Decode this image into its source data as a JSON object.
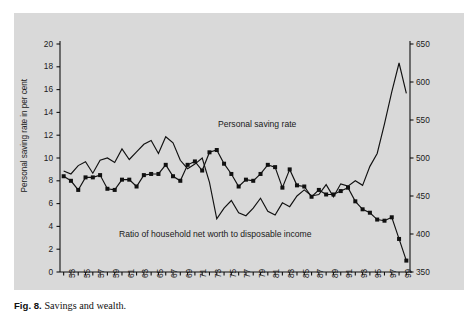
{
  "figure": {
    "caption_label": "Fig. 8.",
    "caption_text": "Savings and wealth."
  },
  "chart_data": {
    "type": "line",
    "title": "",
    "subtitle": "",
    "xlabel": "",
    "grid": false,
    "legend_position": "inline-annotation",
    "x": [
      1953,
      1954,
      1955,
      1956,
      1957,
      1958,
      1959,
      1960,
      1961,
      1962,
      1963,
      1964,
      1965,
      1966,
      1967,
      1968,
      1969,
      1970,
      1971,
      1972,
      1973,
      1974,
      1975,
      1976,
      1977,
      1978,
      1979,
      1980,
      1981,
      1982,
      1983,
      1984,
      1985,
      1986,
      1987,
      1988,
      1989,
      1990,
      1991,
      1992,
      1993,
      1994,
      1995,
      1996,
      1997,
      1998,
      1999,
      2000
    ],
    "xtick_labels": [
      "53",
      "55",
      "57",
      "59",
      "61",
      "63",
      "65",
      "67",
      "69",
      "71",
      "73",
      "75",
      "77",
      "79",
      "81",
      "83",
      "85",
      "87",
      "89",
      "91",
      "93",
      "95",
      "97",
      "99"
    ],
    "xtick_every_years": 2,
    "xlim": [
      1952.5,
      2000.5
    ],
    "axes": [
      {
        "id": "left",
        "label": "Personal saving rate in per cent",
        "ylim": [
          0,
          20
        ],
        "ytick_step": 2,
        "ytick_labels": [
          "0",
          "2",
          "4",
          "6",
          "8",
          "10",
          "12",
          "14",
          "16",
          "18",
          "20"
        ]
      },
      {
        "id": "right",
        "label": "Household net worth as ratio to disposable income, in per cent",
        "ylim": [
          350,
          650
        ],
        "ytick_step": 50,
        "ytick_labels": [
          "350",
          "400",
          "450",
          "500",
          "550",
          "600",
          "650"
        ]
      }
    ],
    "series": [
      {
        "name": "Personal saving rate",
        "axis": "left",
        "marker": "square",
        "color": "#111111",
        "annotation": "Personal saving rate",
        "values": [
          8.4,
          8.0,
          7.2,
          8.3,
          8.3,
          8.5,
          7.3,
          7.2,
          8.1,
          8.1,
          7.5,
          8.5,
          8.6,
          8.6,
          9.4,
          8.4,
          8.0,
          9.4,
          9.7,
          8.9,
          10.5,
          10.7,
          9.5,
          8.6,
          7.5,
          8.1,
          8.0,
          8.6,
          9.4,
          9.2,
          7.4,
          9.0,
          7.6,
          7.5,
          6.6,
          7.2,
          6.8,
          6.8,
          7.1,
          7.4,
          6.2,
          5.5,
          5.2,
          4.6,
          4.5,
          4.8,
          2.9,
          1.0
        ]
      },
      {
        "name": "Ratio of household net worth to disposable income",
        "axis": "right",
        "marker": "none",
        "color": "#111111",
        "annotation": "Ratio of household net worth to disposable income",
        "values": [
          483,
          479,
          490,
          495,
          480,
          497,
          500,
          494,
          512,
          498,
          508,
          518,
          523,
          506,
          528,
          520,
          497,
          486,
          492,
          500,
          468,
          420,
          434,
          444,
          428,
          424,
          434,
          447,
          430,
          425,
          441,
          436,
          450,
          458,
          450,
          452,
          465,
          449,
          466,
          463,
          470,
          464,
          489,
          506,
          545,
          587,
          625,
          585
        ]
      }
    ]
  }
}
